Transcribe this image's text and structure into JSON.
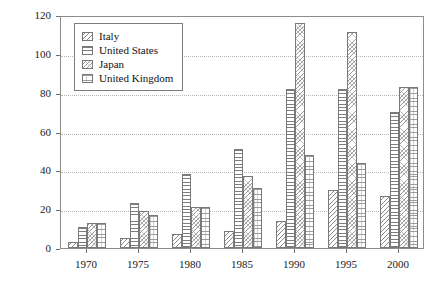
{
  "chart_data": {
    "type": "bar",
    "title": "",
    "subtitle": "",
    "xlabel": "",
    "ylabel": "",
    "ylim": [
      0,
      120
    ],
    "yticks": [
      0,
      20,
      40,
      60,
      80,
      100,
      120
    ],
    "grid": true,
    "legend_position": "top-left inside plot area",
    "categories": [
      "1970",
      "1975",
      "1980",
      "1985",
      "1990",
      "1995",
      "2000"
    ],
    "series": [
      {
        "name": "Italy",
        "pattern": "diagonal-hatch",
        "values": [
          3,
          5,
          7,
          9,
          14,
          30,
          27
        ]
      },
      {
        "name": "United States",
        "pattern": "horizontal-lines",
        "values": [
          11,
          23,
          38,
          51,
          82,
          82,
          70
        ]
      },
      {
        "name": "Japan",
        "pattern": "dotted-diagonal-hatch",
        "values": [
          13,
          19,
          21,
          37,
          116,
          111,
          83
        ]
      },
      {
        "name": "United Kingdom",
        "pattern": "fine-horizontal-lines",
        "values": [
          13,
          17,
          21,
          31,
          48,
          44,
          83
        ]
      }
    ]
  },
  "legend": {
    "items": [
      {
        "label": "Italy"
      },
      {
        "label": "United States"
      },
      {
        "label": "Japan"
      },
      {
        "label": "United Kingdom"
      }
    ]
  }
}
